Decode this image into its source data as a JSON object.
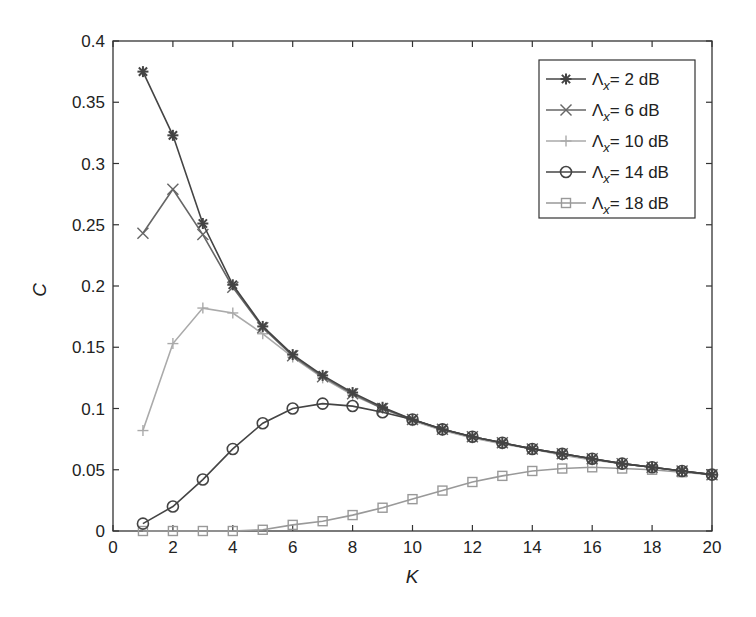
{
  "chart_data": {
    "type": "line",
    "title": "",
    "xlabel": "K",
    "ylabel": "C",
    "xlim": [
      0,
      20
    ],
    "ylim": [
      0,
      0.4
    ],
    "xticks": [
      0,
      2,
      4,
      6,
      8,
      10,
      12,
      14,
      16,
      18,
      20
    ],
    "yticks": [
      0,
      0.05,
      0.1,
      0.15,
      0.2,
      0.25,
      0.3,
      0.35,
      0.4
    ],
    "ytick_labels": [
      "0",
      "0.05",
      "0.1",
      "0.15",
      "0.2",
      "0.25",
      "0.3",
      "0.35",
      "0.4"
    ],
    "grid": false,
    "legend_position": "upper right",
    "x": [
      1,
      2,
      3,
      4,
      5,
      6,
      7,
      8,
      9,
      10,
      11,
      12,
      13,
      14,
      15,
      16,
      17,
      18,
      19,
      20
    ],
    "series": [
      {
        "name": "Λx = 2 dB",
        "label_prefix": "Λ",
        "label_sub": "x",
        "label_suffix": "= 2 dB",
        "marker": "asterisk",
        "color": "#444444",
        "values": [
          0.375,
          0.323,
          0.251,
          0.201,
          0.167,
          0.144,
          0.127,
          0.113,
          0.101,
          0.091,
          0.083,
          0.077,
          0.072,
          0.067,
          0.063,
          0.059,
          0.055,
          0.052,
          0.049,
          0.046
        ]
      },
      {
        "name": "Λx = 6 dB",
        "label_prefix": "Λ",
        "label_sub": "x",
        "label_suffix": "= 6 dB",
        "marker": "x",
        "color": "#666666",
        "values": [
          0.243,
          0.279,
          0.242,
          0.199,
          0.166,
          0.143,
          0.126,
          0.112,
          0.1,
          0.091,
          0.083,
          0.077,
          0.072,
          0.067,
          0.063,
          0.059,
          0.055,
          0.052,
          0.049,
          0.046
        ]
      },
      {
        "name": "Λx = 10 dB",
        "label_prefix": "Λ",
        "label_sub": "x",
        "label_suffix": "= 10 dB",
        "marker": "plus",
        "color": "#aaaaaa",
        "values": [
          0.082,
          0.153,
          0.182,
          0.178,
          0.161,
          0.142,
          0.125,
          0.111,
          0.1,
          0.09,
          0.082,
          0.076,
          0.071,
          0.067,
          0.062,
          0.058,
          0.055,
          0.052,
          0.049,
          0.046
        ]
      },
      {
        "name": "Λx = 14 dB",
        "label_prefix": "Λ",
        "label_sub": "x",
        "label_suffix": "= 14 dB",
        "marker": "circle",
        "color": "#444444",
        "values": [
          0.006,
          0.02,
          0.042,
          0.067,
          0.088,
          0.1,
          0.104,
          0.102,
          0.097,
          0.091,
          0.083,
          0.077,
          0.072,
          0.067,
          0.063,
          0.059,
          0.055,
          0.052,
          0.049,
          0.046
        ]
      },
      {
        "name": "Λx = 18 dB",
        "label_prefix": "Λ",
        "label_sub": "x",
        "label_suffix": "= 18 dB",
        "marker": "square",
        "color": "#999999",
        "values": [
          0.0,
          0.0,
          0.0,
          0.0,
          0.001,
          0.005,
          0.008,
          0.013,
          0.019,
          0.026,
          0.033,
          0.04,
          0.045,
          0.049,
          0.051,
          0.052,
          0.051,
          0.05,
          0.048,
          0.046
        ]
      }
    ]
  }
}
